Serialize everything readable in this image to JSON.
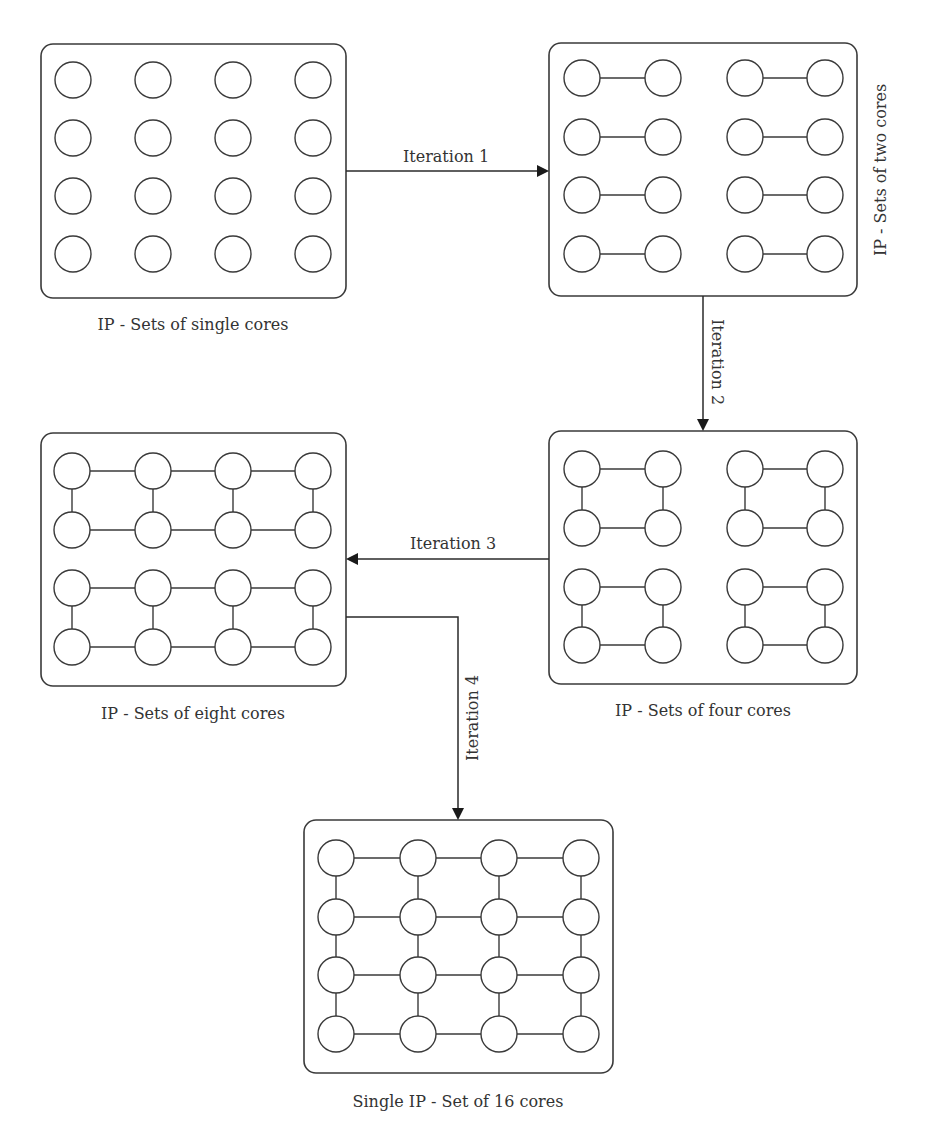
{
  "figure": {
    "panels": [
      {
        "id": "single",
        "caption": "IP - Sets of single cores"
      },
      {
        "id": "two",
        "caption": "IP - Sets of two cores"
      },
      {
        "id": "eight",
        "caption": "IP - Sets of eight cores"
      },
      {
        "id": "four",
        "caption": "IP - Sets of four cores"
      },
      {
        "id": "sixteen",
        "caption": "Single IP - Set of 16 cores"
      }
    ],
    "arrows": [
      {
        "label": "Iteration 1",
        "from": "single",
        "to": "two"
      },
      {
        "label": "Iteration 2",
        "from": "two",
        "to": "four"
      },
      {
        "label": "Iteration 3",
        "from": "four",
        "to": "eight"
      },
      {
        "label": "Iteration 4",
        "from": "eight",
        "to": "sixteen"
      }
    ],
    "grid": {
      "rows": 4,
      "cols": 4,
      "cores_per_panel": 16
    },
    "colors": {
      "stroke": "#3a3a3a",
      "background": "#ffffff",
      "text": "#333333"
    }
  }
}
